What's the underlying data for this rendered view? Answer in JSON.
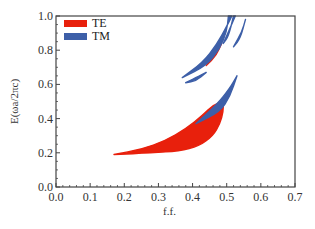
{
  "chart_data": {
    "type": "area",
    "title": "",
    "xlabel": "f.f.",
    "ylabel": "E(ωa/2πc)",
    "xlim": [
      0.0,
      0.7
    ],
    "ylim": [
      0.0,
      1.0
    ],
    "xticks": [
      "0.0",
      "0.1",
      "0.2",
      "0.3",
      "0.4",
      "0.5",
      "0.6",
      "0.7"
    ],
    "yticks": [
      "0.0",
      "0.2",
      "0.4",
      "0.6",
      "0.8",
      "1.0"
    ],
    "grid": false,
    "legend_position": "upper-left",
    "series": [
      {
        "name": "TE",
        "color": "#e8200c",
        "regions": [
          {
            "label": "TE band gap 1 (main)",
            "upper": [
              [
                0.17,
                0.19
              ],
              [
                0.25,
                0.22
              ],
              [
                0.32,
                0.27
              ],
              [
                0.38,
                0.34
              ],
              [
                0.43,
                0.42
              ],
              [
                0.46,
                0.48
              ],
              [
                0.49,
                0.5
              ]
            ],
            "lower": [
              [
                0.17,
                0.19
              ],
              [
                0.28,
                0.2
              ],
              [
                0.36,
                0.21
              ],
              [
                0.42,
                0.24
              ],
              [
                0.46,
                0.3
              ],
              [
                0.48,
                0.37
              ],
              [
                0.49,
                0.44
              ],
              [
                0.49,
                0.5
              ]
            ]
          },
          {
            "label": "TE band gap 2 (narrow sliver)",
            "upper": [
              [
                0.44,
                0.71
              ],
              [
                0.465,
                0.78
              ],
              [
                0.485,
                0.84
              ]
            ],
            "lower": [
              [
                0.44,
                0.71
              ],
              [
                0.47,
                0.77
              ],
              [
                0.485,
                0.84
              ]
            ]
          }
        ]
      },
      {
        "name": "TM",
        "color": "#3d5fa8",
        "regions": [
          {
            "label": "TM blade over TE gap",
            "upper": [
              [
                0.41,
                0.37
              ],
              [
                0.47,
                0.48
              ],
              [
                0.51,
                0.58
              ],
              [
                0.53,
                0.65
              ]
            ],
            "lower": [
              [
                0.41,
                0.37
              ],
              [
                0.48,
                0.44
              ],
              [
                0.51,
                0.53
              ],
              [
                0.53,
                0.65
              ]
            ]
          },
          {
            "label": "TM small gap lower",
            "upper": [
              [
                0.38,
                0.61
              ],
              [
                0.42,
                0.65
              ],
              [
                0.44,
                0.67
              ]
            ],
            "lower": [
              [
                0.38,
                0.61
              ],
              [
                0.41,
                0.62
              ],
              [
                0.44,
                0.67
              ]
            ]
          },
          {
            "label": "TM long diagonal",
            "upper": [
              [
                0.37,
                0.64
              ],
              [
                0.43,
                0.73
              ],
              [
                0.47,
                0.83
              ],
              [
                0.5,
                0.94
              ],
              [
                0.515,
                1.0
              ]
            ],
            "lower": [
              [
                0.37,
                0.64
              ],
              [
                0.44,
                0.71
              ],
              [
                0.48,
                0.81
              ],
              [
                0.5,
                0.91
              ],
              [
                0.505,
                1.0
              ]
            ]
          },
          {
            "label": "TM upper diagonal",
            "upper": [
              [
                0.49,
                0.84
              ],
              [
                0.51,
                0.93
              ],
              [
                0.525,
                1.0
              ]
            ],
            "lower": [
              [
                0.49,
                0.84
              ],
              [
                0.505,
                0.88
              ],
              [
                0.52,
                1.0
              ]
            ]
          },
          {
            "label": "TM right leaf",
            "upper": [
              [
                0.52,
                0.82
              ],
              [
                0.545,
                0.91
              ],
              [
                0.555,
                0.98
              ]
            ],
            "lower": [
              [
                0.52,
                0.82
              ],
              [
                0.54,
                0.87
              ],
              [
                0.555,
                0.98
              ]
            ]
          }
        ]
      }
    ]
  },
  "legend": {
    "items": [
      {
        "label": "TE",
        "color": "#e8200c"
      },
      {
        "label": "TM",
        "color": "#3d5fa8"
      }
    ]
  },
  "layout": {
    "plot_left": 56,
    "plot_right": 295,
    "plot_top": 16,
    "plot_bottom": 187,
    "frame_color": "#444444",
    "tick_color": "#444444"
  }
}
